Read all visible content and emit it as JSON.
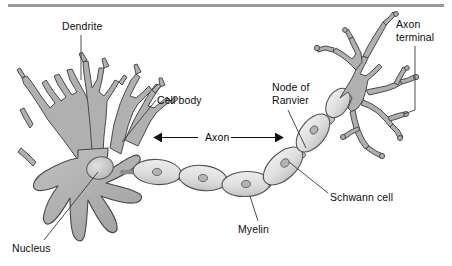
{
  "figure": {
    "type": "labeled anatomical diagram",
    "background_color": "#ffffff",
    "top_rule_color": "#9a9a9a",
    "cell_fill_color": "#b0b0b0",
    "cell_stroke_color": "#4d4d4d",
    "myelin_fill_color": "#dcdcdc",
    "nucleus_fill_color": "#c6c6c6",
    "leader_line_color": "#3a3a3a",
    "text_color": "#0d0d0d"
  },
  "labels": [
    {
      "id": "dendrite",
      "text": "Dendrite",
      "lines": [
        "Dendrite"
      ],
      "x": 62,
      "y": 20,
      "align": "left",
      "leader": "vertical line down to dendrite branch"
    },
    {
      "id": "cell-body",
      "text": "Cell body",
      "lines": [
        "Cell body"
      ],
      "x": 157,
      "y": 94,
      "align": "left",
      "leader": "diagonal line down-left to soma"
    },
    {
      "id": "node-of-ranvier",
      "text": "Node of Ranvier",
      "lines": [
        "Node of",
        "Ranvier"
      ],
      "x": 272,
      "y": 81,
      "align": "left",
      "leader": "diagonal line down-right to gap between myelin segments"
    },
    {
      "id": "axon-terminal",
      "text": "Axon terminal",
      "lines": [
        "Axon",
        "terminal"
      ],
      "x": 396,
      "y": 18,
      "align": "left",
      "leader": "vertical line down with left hook to terminal branches"
    },
    {
      "id": "schwann-cell",
      "text": "Schwann cell",
      "lines": [
        "Schwann cell"
      ],
      "x": 330,
      "y": 191,
      "align": "left",
      "leader": "diagonal line up-left to myelin segment nucleus"
    },
    {
      "id": "myelin",
      "text": "Myelin",
      "lines": [
        "Myelin"
      ],
      "x": 238,
      "y": 223,
      "align": "left",
      "leader": "vertical line up to myelin sheath segment"
    },
    {
      "id": "nucleus",
      "text": "Nucleus",
      "lines": [
        "Nucleus"
      ],
      "x": 12,
      "y": 242,
      "align": "left",
      "leader": "diagonal line up-right to nucleus in soma"
    }
  ],
  "axon_arrow": {
    "label": "Axon",
    "text_x": 206,
    "text_y": 131,
    "arrow_y": 137,
    "arrow_x_start": 160,
    "arrow_x_end": 277,
    "double_headed": true
  },
  "structures": {
    "dendrites": "branched tree-like processes at upper left of soma",
    "soma": "central star-shaped cell body",
    "nucleus": "oval body inside soma",
    "axon": "long process running from soma to upper right",
    "myelin_segments": 5,
    "nodes_of_ranvier": 4,
    "axon_terminals": "branched arborization at upper right"
  }
}
